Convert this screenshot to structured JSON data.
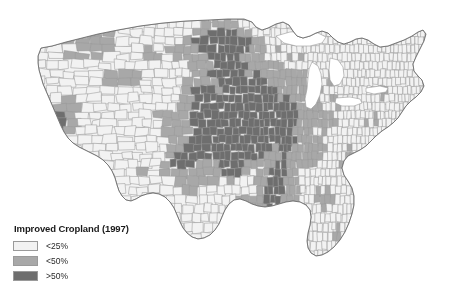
{
  "figure": {
    "kind": "choropleth-map",
    "region": "United States (contiguous), county level",
    "background_color": "#ffffff"
  },
  "legend": {
    "title": "Improved Cropland (1997)",
    "items": [
      {
        "label": "<25%",
        "color": "#f2f2f2",
        "swatch_name": "legend-swatch-low"
      },
      {
        "label": "<50%",
        "color": "#a8a8a8",
        "swatch_name": "legend-swatch-mid"
      },
      {
        "label": ">50%",
        "color": "#6e6e6e",
        "swatch_name": "legend-swatch-high"
      }
    ]
  },
  "chart_data": {
    "type": "heatmap",
    "title": "Improved Cropland (1997)",
    "subtitle": "",
    "xlabel": "",
    "ylabel": "",
    "legend_position": "bottom-left",
    "grid": false,
    "map_projection": "albers-usa",
    "classes": [
      {
        "name": "<25%",
        "color": "#f2f2f2",
        "min": 0,
        "max": 25
      },
      {
        "name": "<50%",
        "color": "#a8a8a8",
        "min": 25,
        "max": 50
      },
      {
        "name": ">50%",
        "color": "#6e6e6e",
        "min": 50,
        "max": 100
      }
    ],
    "county_border_color": "#9b9b9b",
    "water_color": "#ffffff",
    "regions": [
      {
        "name": "Iowa",
        "class": ">50%"
      },
      {
        "name": "Illinois",
        "class": ">50%"
      },
      {
        "name": "Indiana",
        "class": ">50%"
      },
      {
        "name": "Ohio (west)",
        "class": ">50%"
      },
      {
        "name": "Nebraska (east)",
        "class": ">50%"
      },
      {
        "name": "Kansas",
        "class": ">50%"
      },
      {
        "name": "North Dakota",
        "class": ">50%"
      },
      {
        "name": "South Dakota (east)",
        "class": ">50%"
      },
      {
        "name": "Minnesota (south)",
        "class": ">50%"
      },
      {
        "name": "Missouri (north)",
        "class": ">50%"
      },
      {
        "name": "Texas Panhandle",
        "class": ">50%"
      },
      {
        "name": "Mississippi Delta",
        "class": ">50%"
      },
      {
        "name": "California Central Valley",
        "class": ">50%"
      },
      {
        "name": "Columbia Basin (Washington)",
        "class": "<50%"
      },
      {
        "name": "Snake River Plain (Idaho)",
        "class": "<50%"
      },
      {
        "name": "Michigan",
        "class": "<25%"
      },
      {
        "name": "Wisconsin (north)",
        "class": "<25%"
      },
      {
        "name": "Appalachians",
        "class": "<25%"
      },
      {
        "name": "New England",
        "class": "<25%"
      },
      {
        "name": "Florida",
        "class": "<25%"
      },
      {
        "name": "Great Basin (Nevada)",
        "class": "<25%"
      },
      {
        "name": "Arizona",
        "class": "<25%"
      },
      {
        "name": "Rocky Mountains",
        "class": "<25%"
      },
      {
        "name": "Gulf Coast",
        "class": "<25%"
      },
      {
        "name": "Southeast Coastal Plain",
        "class": "<25%"
      }
    ]
  }
}
